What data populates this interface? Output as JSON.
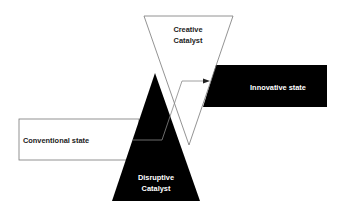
{
  "diagram": {
    "creative_catalyst": {
      "line1": "Creative",
      "line2": "Catalyst"
    },
    "disruptive_catalyst": {
      "line1": "Disruptive",
      "line2": "Catalyst"
    },
    "innovative_state": {
      "label": "Innovative state"
    },
    "conventional_state": {
      "label": "Conventional state"
    },
    "colors": {
      "dark": "#000000",
      "light": "#ffffff",
      "stroke": "#555555",
      "text_dark": "#222222"
    }
  }
}
